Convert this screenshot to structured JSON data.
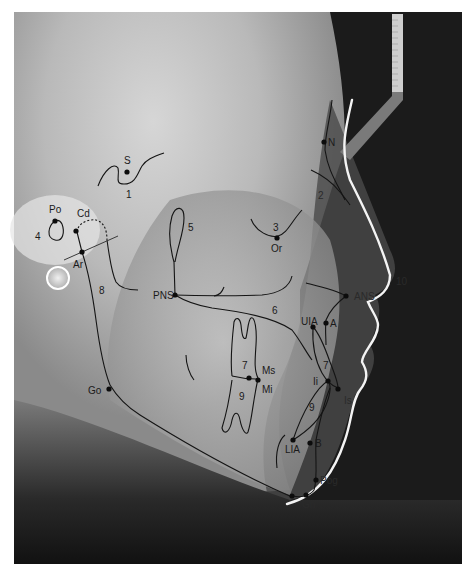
{
  "figure": {
    "type": "lateral cephalometric radiograph with tracing",
    "landmarks": [
      {
        "id": "S",
        "label": "S"
      },
      {
        "id": "N",
        "label": "N"
      },
      {
        "id": "Po",
        "label": "Po"
      },
      {
        "id": "Cd",
        "label": "Cd"
      },
      {
        "id": "Ar",
        "label": "Ar"
      },
      {
        "id": "Or",
        "label": "Or"
      },
      {
        "id": "PNS",
        "label": "PNS"
      },
      {
        "id": "ANS",
        "label": "ANS"
      },
      {
        "id": "A",
        "label": "A"
      },
      {
        "id": "UIA",
        "label": "UIA"
      },
      {
        "id": "Ms",
        "label": "Ms"
      },
      {
        "id": "Mi",
        "label": "Mi"
      },
      {
        "id": "Ii",
        "label": "Ii"
      },
      {
        "id": "Is",
        "label": "Is"
      },
      {
        "id": "Go",
        "label": "Go"
      },
      {
        "id": "LIA",
        "label": "LIA"
      },
      {
        "id": "B",
        "label": "B"
      },
      {
        "id": "Pog",
        "label": "Pog"
      },
      {
        "id": "Gn",
        "label": "Gn"
      }
    ],
    "structures": [
      {
        "id": "1",
        "label": "1"
      },
      {
        "id": "2",
        "label": "2"
      },
      {
        "id": "3",
        "label": "3"
      },
      {
        "id": "4",
        "label": "4"
      },
      {
        "id": "5",
        "label": "5"
      },
      {
        "id": "6",
        "label": "6"
      },
      {
        "id": "7a",
        "label": "7"
      },
      {
        "id": "7b",
        "label": "7"
      },
      {
        "id": "8",
        "label": "8"
      },
      {
        "id": "9a",
        "label": "9"
      },
      {
        "id": "9b",
        "label": "9"
      },
      {
        "id": "10",
        "label": "10"
      }
    ]
  }
}
